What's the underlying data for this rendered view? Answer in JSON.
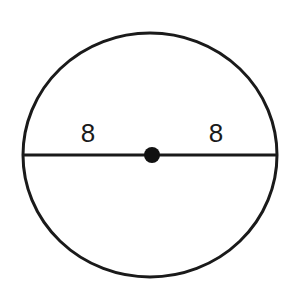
{
  "diagram": {
    "type": "circle-with-diameter",
    "circle": {
      "cx": 150,
      "cy": 155,
      "rx": 127,
      "ry": 122,
      "stroke": "#1a1a1a",
      "stroke_width": 3
    },
    "diameter": {
      "x1": 23,
      "x2": 277,
      "y": 155
    },
    "center_point": {
      "cx": 152,
      "cy": 155,
      "r": 8,
      "fill": "#111111"
    },
    "labels": [
      {
        "text": "8",
        "x": 88,
        "y": 142
      },
      {
        "text": "8",
        "x": 216,
        "y": 142
      }
    ]
  }
}
